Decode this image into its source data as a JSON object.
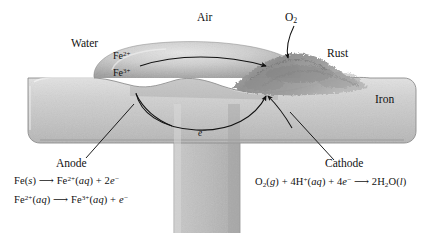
{
  "diagram": {
    "labels": {
      "air": "Air",
      "water": "Water",
      "rust": "Rust",
      "iron": "Iron",
      "oxygen": "O2",
      "anode": "Anode",
      "cathode": "Cathode",
      "electron_flow": "e-",
      "ion_fe2": "Fe2+",
      "ion_fe3": "Fe3+"
    },
    "equations": {
      "anode_line1": "Fe(s) ⟶ Fe2+(aq) + 2e-",
      "anode_line2": "Fe2+(aq) ⟶ Fe3+(aq) + e-",
      "cathode_line1": "O2(g) + 4H+(aq) + 4e- ⟶ 2H2O(l)"
    },
    "colors": {
      "background": "#ffffff",
      "iron_light": "#d7d7d7",
      "iron_mid": "#bdbdbd",
      "iron_dark": "#a9a9a9",
      "iron_outline": "#8f8f8f",
      "water_light": "#d2d2d2",
      "water_dark": "#9e9e9e",
      "rust_dark": "#7a7a7a",
      "rust_mid": "#9c9c9c",
      "ink": "#111111"
    }
  }
}
